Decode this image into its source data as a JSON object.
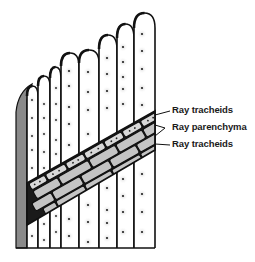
{
  "figure": {
    "colors": {
      "outline": "#111111",
      "cell_fill": "#ffffff",
      "pit_fill": "#e6e6e6",
      "pit_dot": "#222222",
      "side_face": "#8a8a8a",
      "parenchyma_fill": "#c8c8c8",
      "tracheid_ray_fill": "#d8d8d8"
    }
  },
  "labels": [
    {
      "id": "ray-tracheids-top",
      "text": "Ray tracheids"
    },
    {
      "id": "ray-parenchyma",
      "text": "Ray parenchyma"
    },
    {
      "id": "ray-tracheids-bottom",
      "text": "Ray tracheids"
    }
  ]
}
